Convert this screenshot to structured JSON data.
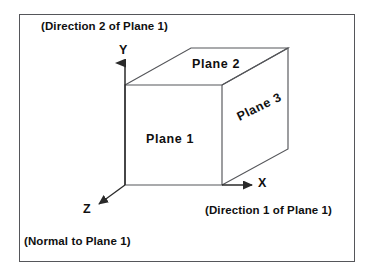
{
  "figure": {
    "background_color": "#ffffff",
    "line_color": "#55565a",
    "text_color": "#101010",
    "border_color": "#55565a"
  },
  "annotations": {
    "direction2": "(Direction 2 of Plane 1)",
    "direction1": "(Direction 1 of Plane 1)",
    "normal": "(Normal to  Plane 1)"
  },
  "axes": [
    {
      "name": "y-axis",
      "label": "Y",
      "direction": "up",
      "note": "(Direction 2 of Plane 1)"
    },
    {
      "name": "x-axis",
      "label": "X",
      "direction": "right",
      "note": "(Direction 1 of Plane 1)"
    },
    {
      "name": "z-axis",
      "label": "Z",
      "direction": "down-left",
      "note": "(Normal to  Plane 1)"
    }
  ],
  "planes": [
    {
      "id": 1,
      "label": "Plane 1",
      "face": "front",
      "rotation_deg": 0
    },
    {
      "id": 2,
      "label": "Plane 2",
      "face": "top",
      "rotation_deg": 0
    },
    {
      "id": 3,
      "label": "Plane 3",
      "face": "right",
      "rotation_deg": -26
    }
  ],
  "geometry": {
    "front_face": {
      "left": 125,
      "top": 85,
      "right": 222,
      "bottom": 185
    },
    "depth_offset": {
      "dx": 66,
      "dy": -37
    },
    "origin": {
      "x": 125,
      "y": 185
    }
  }
}
